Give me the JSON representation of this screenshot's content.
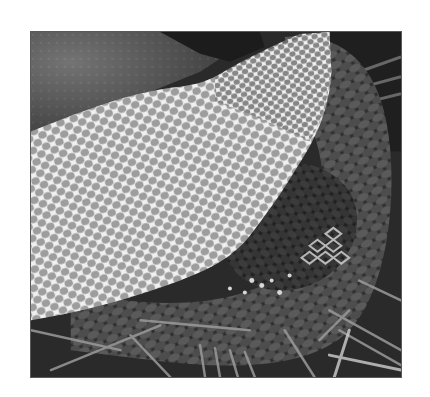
{
  "image": {
    "subject": "snake shedding its skin",
    "description": "Grayscale photograph of a snake with its shed skin (translucent honeycomb-patterned slough) lying over its coiled body on a bed of pine needles",
    "tone": "grayscale",
    "frame": {
      "border_color": "#5a5a5a",
      "margin_color": "#ffffff"
    },
    "elements": [
      {
        "name": "shed-skin",
        "tone": "#e6e6e6"
      },
      {
        "name": "snake-body",
        "tone": "#3a3a3a"
      },
      {
        "name": "pine-needles",
        "tone": "#9a9a9a"
      },
      {
        "name": "background-ground",
        "tone": "#2b2b2b"
      }
    ]
  }
}
